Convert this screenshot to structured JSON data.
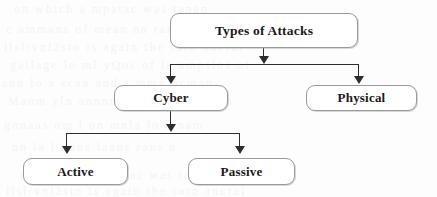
{
  "diagram": {
    "type": "tree",
    "title_node": "Types of Attacks",
    "nodes": [
      {
        "id": "root",
        "label": "Types of Attacks",
        "level": 1
      },
      {
        "id": "cyber",
        "label": "Cyber",
        "level": 2
      },
      {
        "id": "physical",
        "label": "Physical",
        "level": 2
      },
      {
        "id": "active",
        "label": "Active",
        "level": 3
      },
      {
        "id": "passive",
        "label": "Passive",
        "level": 3
      }
    ],
    "edges": [
      {
        "from": "root",
        "to": "cyber"
      },
      {
        "from": "root",
        "to": "physical"
      },
      {
        "from": "cyber",
        "to": "active"
      },
      {
        "from": "cyber",
        "to": "passive"
      }
    ],
    "style": {
      "node_border_color": "#9a9a9a",
      "node_fill_color": "#ffffff",
      "text_color": "#1a1a1a",
      "connector_color": "#2e2e2e",
      "background_color": "#fdfdfd"
    }
  },
  "background_bleed": {
    "visible": true,
    "rows": [
      "on    which    a   mpatac   was    tanan",
      "c  ammans  of  mean na  ramen  chan",
      "llsl/vnl2sto  is  again  the  sarn  ancral",
      "gatlage  lo  ml  yQos  of  la   ampslos  of",
      "anu  lo  a  scan  and  a  mmn  ncman",
      "Maom  yln  annnmm  alss  am  caman",
      "gnnaas  om  l   on  mnla  lo   a  nam",
      "nn   la  l   nnns     laans   rans   n"
    ]
  }
}
